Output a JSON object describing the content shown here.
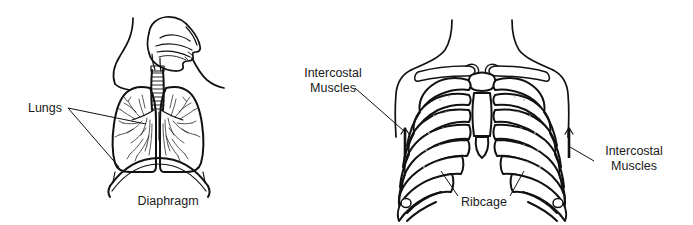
{
  "figure": {
    "background_color": "#ffffff",
    "ink_color": "#111111",
    "width": 693,
    "height": 225
  },
  "panels": [
    {
      "id": "lungs-panel",
      "name": "Lungs, trachea and diaphragm diagram",
      "labels": [
        {
          "id": "lungs",
          "text": "Lungs",
          "x": 62,
          "y": 108,
          "anchor": "end",
          "leader_count": 2
        },
        {
          "id": "diaphragm",
          "text": "Diaphragm",
          "x": 168,
          "y": 201,
          "anchor": "middle",
          "leader_count": 0
        }
      ]
    },
    {
      "id": "ribcage-panel",
      "name": "Ribcage and intercostal muscles diagram",
      "labels": [
        {
          "id": "intercostal-muscles-left",
          "line1": "Intercostal",
          "line2": "Muscles",
          "x": 333,
          "y": 78,
          "anchor": "middle",
          "leader_count": 1
        },
        {
          "id": "intercostal-muscles-right",
          "line1": "Intercostal",
          "line2": "Muscles",
          "x": 634,
          "y": 156,
          "anchor": "middle",
          "leader_count": 1
        },
        {
          "id": "ribcage",
          "text": "Ribcage",
          "x": 484,
          "y": 202,
          "anchor": "middle",
          "leader_count": 2
        }
      ],
      "rib_pairs_visible": 10
    }
  ],
  "accessibility": {
    "left_figure_alt": "Side-front view of the head, neck, trachea, lungs with bronchial tree, and the dome-shaped diaphragm beneath them.",
    "right_figure_alt": "Front view of the human ribcage with clavicles, sternum and ten rib pairs, with markers indicating the intercostal muscles between the ribs."
  }
}
